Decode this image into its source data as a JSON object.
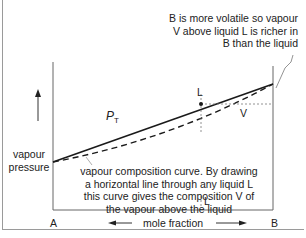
{
  "diagram": {
    "title_faint": "",
    "callout": {
      "lines": [
        "B is more volatile so vapour",
        "V above liquid L is richer in",
        "B than the liquid"
      ]
    },
    "annotation": {
      "lines": [
        "vapour composition curve. By drawing",
        "a horizontal line through any liquid L",
        "this curve gives the composition V of",
        "the vapour above the liquid"
      ]
    },
    "y_axis_label": {
      "lines": [
        "vapour",
        "pressure"
      ]
    },
    "x_axis": {
      "left_end": "A",
      "right_end": "B",
      "label": "mole fraction"
    },
    "curves": {
      "total_pressure_label": "P",
      "total_pressure_subscript": "T",
      "liquid_point_label": "L",
      "vapour_point_label": "V",
      "liquid_axis_marker": "L"
    },
    "colors": {
      "line": "#1a1a1a",
      "axis": "#555555",
      "dotted": "#777777",
      "frame": "#9a9a9a"
    }
  }
}
